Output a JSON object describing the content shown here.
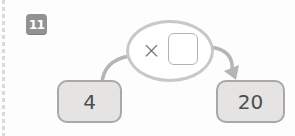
{
  "exercise": {
    "number": "11",
    "operator": "×",
    "start_value": "4",
    "result_value": "20",
    "answer_value": ""
  },
  "icons": {
    "arrow": "curved-arrow-left-box-through-bubble-to-right-box"
  },
  "colors": {
    "badge_bg": "#929292",
    "badge_text": "#ffffff",
    "box_fill": "#e5e4e2",
    "box_border": "#a8a8a8",
    "ellipse_border": "#c8c8c8",
    "arrow": "#b5b5b5",
    "text": "#4d4d4d"
  }
}
